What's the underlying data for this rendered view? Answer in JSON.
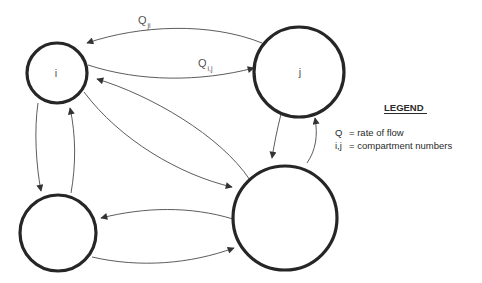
{
  "diagram": {
    "type": "compartment-flow-diagram",
    "nodes": [
      {
        "id": "i",
        "label": "i"
      },
      {
        "id": "j",
        "label": "j"
      },
      {
        "id": "bottom-left",
        "label": ""
      },
      {
        "id": "bottom-right",
        "label": ""
      }
    ],
    "edges": [
      {
        "from": "j",
        "to": "i",
        "label_main": "Q",
        "label_sub": "ji"
      },
      {
        "from": "i",
        "to": "j",
        "label_main": "Q",
        "label_sub": "i,j"
      },
      {
        "from": "i",
        "to": "bottom-left"
      },
      {
        "from": "bottom-left",
        "to": "i"
      },
      {
        "from": "i",
        "to": "bottom-right"
      },
      {
        "from": "bottom-right",
        "to": "i"
      },
      {
        "from": "j",
        "to": "bottom-right"
      },
      {
        "from": "bottom-right",
        "to": "j"
      },
      {
        "from": "bottom-left",
        "to": "bottom-right"
      },
      {
        "from": "bottom-right",
        "to": "bottom-left"
      }
    ]
  },
  "legend": {
    "title": "LEGEND",
    "entries": [
      {
        "symbol": "Q",
        "description": "= rate of flow"
      },
      {
        "symbol": "i,j",
        "description": "= compartment numbers"
      }
    ]
  },
  "colors": {
    "stroke": "#262626",
    "edge": "#4a4a4a",
    "text": "#555555",
    "background": "#ffffff"
  }
}
